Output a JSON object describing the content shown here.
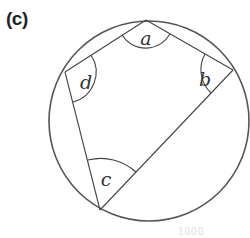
{
  "figure": {
    "panel_label": "(c)",
    "colors": {
      "stroke": "#555555",
      "text": "#333333",
      "background": "#ffffff"
    },
    "circle": {
      "cx": 149,
      "cy": 121,
      "r": 100
    },
    "vertices": {
      "A": {
        "x": 146,
        "y": 20
      },
      "B": {
        "x": 233,
        "y": 70
      },
      "C": {
        "x": 100,
        "y": 210
      },
      "D": {
        "x": 65,
        "y": 72
      }
    },
    "angles": [
      {
        "vertex": "A",
        "label": "a"
      },
      {
        "vertex": "B",
        "label": "b"
      },
      {
        "vertex": "C",
        "label": "c"
      },
      {
        "vertex": "D",
        "label": "d"
      }
    ],
    "labels": {
      "a": "a",
      "b": "b",
      "c": "c",
      "d": "d"
    },
    "watermark_fragment": "1000"
  }
}
